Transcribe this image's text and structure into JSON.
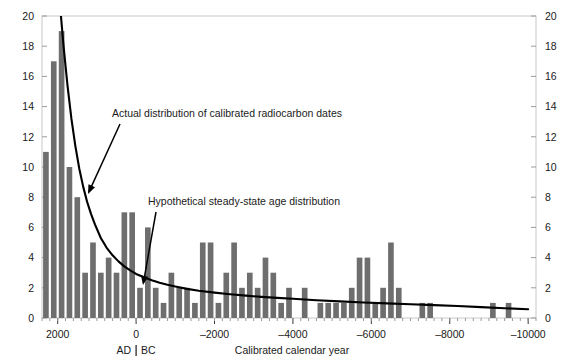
{
  "chart_data": {
    "type": "bar",
    "title": "",
    "subtitle": "",
    "xlabel": "Calibrated calendar year",
    "ylabel": "",
    "xlim": [
      2400,
      -10200
    ],
    "ylim": [
      0,
      20
    ],
    "grid": false,
    "legend_position": "none",
    "x_ticks": [
      2000,
      0,
      -2000,
      -4000,
      -6000,
      -8000,
      -10000
    ],
    "x_tick_labels": [
      "2000",
      "0",
      "–2000",
      "–4000",
      "–6000",
      "–8000",
      "–10000"
    ],
    "y_ticks": [
      0,
      2,
      4,
      6,
      8,
      10,
      12,
      14,
      16,
      18,
      20
    ],
    "y_tick_labels": [
      "0",
      "2",
      "4",
      "6",
      "8",
      "10",
      "12",
      "14",
      "16",
      "18",
      "20"
    ],
    "y_ticks_right": [
      0,
      2,
      4,
      6,
      8,
      10,
      12,
      14,
      16,
      18,
      20
    ],
    "y_tick_labels_right": [
      "0",
      "2",
      "4",
      "6",
      "8",
      "10",
      "12",
      "14",
      "16",
      "18",
      "20"
    ],
    "era_label_ad": "AD",
    "era_label_bc": "BC",
    "era_divider_x": 0,
    "bar_color": "#6e6e6e",
    "line_color": "#000000",
    "bin_width": 200,
    "categories": [
      2300,
      2100,
      1900,
      1700,
      1500,
      1300,
      1100,
      900,
      700,
      500,
      300,
      100,
      -100,
      -300,
      -500,
      -700,
      -900,
      -1100,
      -1300,
      -1500,
      -1700,
      -1900,
      -2100,
      -2300,
      -2500,
      -2700,
      -2900,
      -3100,
      -3300,
      -3500,
      -3700,
      -3900,
      -4100,
      -4300,
      -4500,
      -4700,
      -4900,
      -5100,
      -5300,
      -5500,
      -5700,
      -5900,
      -6100,
      -6300,
      -6500,
      -6700,
      -6900,
      -7100,
      -7300,
      -7500,
      -7700,
      -7900,
      -8100,
      -8300,
      -8500,
      -8700,
      -8900,
      -9100,
      -9300,
      -9500,
      -9700,
      -9900
    ],
    "values": [
      11,
      17,
      19,
      10,
      8,
      3,
      5,
      3,
      4,
      3,
      7,
      7,
      2,
      6,
      2,
      1,
      3,
      2,
      2,
      1,
      5,
      5,
      1,
      3,
      5,
      2,
      3,
      2,
      4,
      3,
      1,
      2,
      0,
      2,
      0,
      1,
      1,
      1,
      1,
      2,
      4,
      4,
      1,
      2,
      5,
      2,
      0,
      0,
      1,
      1,
      0,
      0,
      0,
      0,
      0,
      0,
      0,
      1,
      0,
      1,
      0,
      0
    ],
    "series": [
      {
        "name": "Actual distribution of calibrated radiocarbon dates",
        "type": "bar",
        "values": [
          11,
          17,
          19,
          10,
          8,
          3,
          5,
          3,
          4,
          3,
          7,
          7,
          2,
          6,
          2,
          1,
          3,
          2,
          2,
          1,
          5,
          5,
          1,
          3,
          5,
          2,
          3,
          2,
          4,
          3,
          1,
          2,
          0,
          2,
          0,
          1,
          1,
          1,
          1,
          2,
          4,
          4,
          1,
          2,
          5,
          2,
          0,
          0,
          1,
          1,
          0,
          0,
          0,
          0,
          0,
          0,
          0,
          1,
          0,
          1,
          0,
          0
        ]
      },
      {
        "name": "Hypothetical steady-state age distribution",
        "type": "line",
        "x": [
          2350,
          2200,
          2050,
          1950,
          1850,
          1750,
          1650,
          1550,
          1450,
          1350,
          1250,
          1150,
          1050,
          900,
          750,
          600,
          450,
          300,
          150,
          0,
          -200,
          -400,
          -600,
          -800,
          -1000,
          -1300,
          -1600,
          -2000,
          -2400,
          -2800,
          -3200,
          -3600,
          -4000,
          -4600,
          -5200,
          -5800,
          -6400,
          -7000,
          -7600,
          -8200,
          -8800,
          -9400,
          -10000
        ],
        "y": [
          40,
          31,
          24.5,
          21,
          18,
          15.4,
          13.2,
          11.4,
          9.9,
          8.7,
          7.7,
          6.9,
          6.2,
          5.3,
          4.65,
          4.15,
          3.75,
          3.42,
          3.15,
          2.92,
          2.7,
          2.5,
          2.34,
          2.2,
          2.08,
          1.93,
          1.81,
          1.68,
          1.57,
          1.48,
          1.4,
          1.33,
          1.27,
          1.18,
          1.1,
          1.03,
          0.97,
          0.91,
          0.85,
          0.79,
          0.72,
          0.65,
          0.58
        ]
      }
    ],
    "annotations": [
      {
        "id": "actual-distribution",
        "text": "Actual distribution of calibrated radiocarbon dates",
        "text_x": 112,
        "text_y": 117,
        "arrow_from_x": 120,
        "arrow_from_y": 124,
        "arrow_to_x": 88,
        "arrow_to_y": 194
      },
      {
        "id": "hypothetical-steady-state",
        "text": "Hypothetical steady-state age distribution",
        "text_x": 148,
        "text_y": 205,
        "arrow_from_x": 156,
        "arrow_from_y": 212,
        "arrow_to_x": 143,
        "arrow_to_y": 285
      }
    ]
  }
}
